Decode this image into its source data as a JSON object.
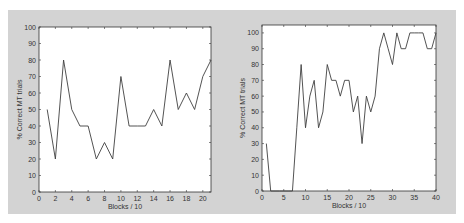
{
  "chart_data": [
    {
      "type": "line",
      "title": "",
      "xlabel": "Blocks / 10",
      "ylabel": "% Correct MT trials",
      "xlim": [
        0,
        21
      ],
      "ylim": [
        0,
        100
      ],
      "xticks": [
        0,
        2,
        4,
        6,
        8,
        10,
        12,
        14,
        16,
        18,
        20
      ],
      "yticks": [
        0,
        10,
        20,
        30,
        40,
        50,
        60,
        70,
        80,
        90,
        100
      ],
      "grid": false,
      "line_color": "#404040",
      "x": [
        1,
        2,
        3,
        4,
        5,
        6,
        7,
        8,
        9,
        10,
        11,
        12,
        13,
        14,
        15,
        16,
        17,
        18,
        19,
        20,
        21
      ],
      "values": [
        50,
        20,
        80,
        50,
        40,
        40,
        20,
        30,
        20,
        70,
        40,
        40,
        40,
        50,
        40,
        80,
        50,
        60,
        50,
        70,
        80
      ]
    },
    {
      "type": "line",
      "title": "",
      "xlabel": "Blocks / 10",
      "ylabel": "% Correct MT trials",
      "xlim": [
        0,
        40
      ],
      "ylim": [
        0,
        105
      ],
      "xticks": [
        0,
        5,
        10,
        15,
        20,
        25,
        30,
        35,
        40
      ],
      "yticks": [
        0,
        10,
        20,
        30,
        40,
        50,
        60,
        70,
        80,
        90,
        100
      ],
      "grid": false,
      "line_color": "#404040",
      "x": [
        1,
        2,
        3,
        4,
        5,
        6,
        7,
        8,
        9,
        10,
        11,
        12,
        13,
        14,
        15,
        16,
        17,
        18,
        19,
        20,
        21,
        22,
        23,
        24,
        25,
        26,
        27,
        28,
        29,
        30,
        31,
        32,
        33,
        34,
        35,
        36,
        37,
        38,
        39,
        40
      ],
      "values": [
        30,
        0,
        0,
        0,
        0,
        0,
        0,
        40,
        80,
        40,
        60,
        70,
        40,
        50,
        80,
        70,
        70,
        60,
        70,
        70,
        50,
        60,
        30,
        60,
        50,
        60,
        90,
        100,
        90,
        80,
        100,
        90,
        90,
        100,
        100,
        100,
        100,
        90,
        90,
        100
      ]
    }
  ],
  "colors": {
    "panel_background": "#d3d3d3",
    "plot_background": "#ffffff",
    "line": "#404040",
    "axis": "#333333"
  }
}
